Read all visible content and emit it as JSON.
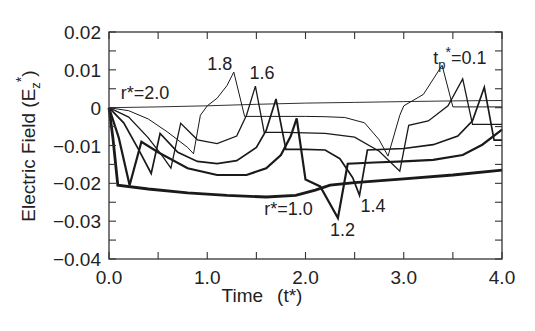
{
  "chart_data": {
    "type": "line",
    "title": "",
    "xlabel": "Time",
    "xlabel_symbol": "(t*)",
    "ylabel": "Electric Field (E",
    "ylabel_sub": "z",
    "ylabel_sup": "*",
    "ylabel_close": ")",
    "xlim": [
      0.0,
      4.0
    ],
    "ylim": [
      -0.04,
      0.02
    ],
    "grid": false,
    "legend": "none (inline annotations)",
    "x_ticks": [
      {
        "value": 0.0,
        "label": "0.0"
      },
      {
        "value": 1.0,
        "label": "1.0"
      },
      {
        "value": 2.0,
        "label": "2.0"
      },
      {
        "value": 3.0,
        "label": "3.0"
      },
      {
        "value": 4.0,
        "label": "4.0"
      }
    ],
    "x_minor_ticks": [
      0.5,
      1.5,
      2.5,
      3.5
    ],
    "y_ticks": [
      {
        "value": 0.02,
        "label": "0.02"
      },
      {
        "value": 0.01,
        "label": "0.01"
      },
      {
        "value": 0.0,
        "label": "0"
      },
      {
        "value": -0.01,
        "label": "−0.01"
      },
      {
        "value": -0.02,
        "label": "−0.02"
      },
      {
        "value": -0.03,
        "label": "−0.03"
      },
      {
        "value": -0.04,
        "label": "−0.04"
      }
    ],
    "y_minor_ticks": [
      0.015,
      0.005,
      -0.005,
      -0.015,
      -0.025,
      -0.035
    ],
    "series": [
      {
        "name": "r*=2.0",
        "stroke_width": 0.9,
        "points": [
          [
            0,
            0
          ],
          [
            0.5,
            0.0002
          ],
          [
            1.0,
            0.0005
          ],
          [
            1.5,
            0.0009
          ],
          [
            2.0,
            0.0012
          ],
          [
            2.5,
            0.0014
          ],
          [
            3.0,
            0.0016
          ],
          [
            3.5,
            0.0018
          ],
          [
            4.0,
            0.0019
          ]
        ]
      },
      {
        "name": "r*=1.8",
        "stroke_width": 1.0,
        "points": [
          [
            0,
            0
          ],
          [
            0.2,
            -0.0008
          ],
          [
            0.4,
            -0.003
          ],
          [
            0.6,
            -0.0065
          ],
          [
            0.8,
            -0.0105
          ],
          [
            0.86,
            -0.0122
          ],
          [
            0.93,
            -0.002
          ],
          [
            1.0,
            0.0005
          ],
          [
            1.1,
            0.0025
          ],
          [
            1.2,
            0.0058
          ],
          [
            1.27,
            0.0094
          ],
          [
            1.38,
            -0.0023
          ],
          [
            1.6,
            -0.0023
          ],
          [
            2.0,
            -0.0023
          ],
          [
            2.2,
            -0.0024
          ],
          [
            2.4,
            -0.0026
          ],
          [
            2.6,
            -0.004
          ],
          [
            2.75,
            -0.0085
          ],
          [
            2.84,
            -0.0128
          ],
          [
            2.96,
            -0.002
          ],
          [
            3.0,
            0.0005
          ],
          [
            3.2,
            0.0035
          ],
          [
            3.39,
            0.0112
          ],
          [
            3.5,
            0.0002
          ],
          [
            3.8,
            0.0002
          ],
          [
            4.0,
            0.0002
          ]
        ]
      },
      {
        "name": "r*=1.6",
        "stroke_width": 1.3,
        "points": [
          [
            0,
            0
          ],
          [
            0.2,
            -0.0025
          ],
          [
            0.4,
            -0.008
          ],
          [
            0.55,
            -0.013
          ],
          [
            0.63,
            -0.016
          ],
          [
            0.73,
            -0.0041
          ],
          [
            0.9,
            -0.0085
          ],
          [
            1.1,
            -0.0095
          ],
          [
            1.3,
            -0.0075
          ],
          [
            1.4,
            -0.002
          ],
          [
            1.49,
            0.0057
          ],
          [
            1.58,
            -0.0065
          ],
          [
            1.8,
            -0.0065
          ],
          [
            2.2,
            -0.0068
          ],
          [
            2.5,
            -0.0078
          ],
          [
            2.75,
            -0.0115
          ],
          [
            2.96,
            -0.0168
          ],
          [
            3.05,
            -0.0047
          ],
          [
            3.25,
            -0.0035
          ],
          [
            3.45,
            0.0005
          ],
          [
            3.6,
            0.0076
          ],
          [
            3.7,
            -0.0044
          ],
          [
            4.0,
            -0.0044
          ]
        ]
      },
      {
        "name": "r*=1.4",
        "stroke_width": 1.7,
        "points": [
          [
            0,
            0
          ],
          [
            0.15,
            -0.004
          ],
          [
            0.3,
            -0.011
          ],
          [
            0.43,
            -0.0174
          ],
          [
            0.52,
            -0.0068
          ],
          [
            0.7,
            -0.0118
          ],
          [
            0.9,
            -0.0142
          ],
          [
            1.1,
            -0.0148
          ],
          [
            1.3,
            -0.014
          ],
          [
            1.5,
            -0.0105
          ],
          [
            1.6,
            -0.006
          ],
          [
            1.7,
            0.0023
          ],
          [
            1.8,
            -0.011
          ],
          [
            2.0,
            -0.011
          ],
          [
            2.2,
            -0.0112
          ],
          [
            2.35,
            -0.0135
          ],
          [
            2.48,
            -0.0185
          ],
          [
            2.55,
            -0.0232
          ],
          [
            2.63,
            -0.0112
          ],
          [
            3.0,
            -0.0108
          ],
          [
            3.3,
            -0.0098
          ],
          [
            3.55,
            -0.0075
          ],
          [
            3.7,
            -0.0035
          ],
          [
            3.82,
            0.0054
          ],
          [
            3.92,
            -0.0086
          ],
          [
            4.0,
            -0.0086
          ]
        ]
      },
      {
        "name": "r*=1.2",
        "stroke_width": 2.2,
        "points": [
          [
            0,
            0
          ],
          [
            0.1,
            -0.008
          ],
          [
            0.21,
            -0.0205
          ],
          [
            0.33,
            -0.009
          ],
          [
            0.5,
            -0.0118
          ],
          [
            0.8,
            -0.016
          ],
          [
            1.1,
            -0.0178
          ],
          [
            1.4,
            -0.0178
          ],
          [
            1.6,
            -0.016
          ],
          [
            1.75,
            -0.0125
          ],
          [
            1.85,
            -0.0075
          ],
          [
            1.91,
            -0.0028
          ],
          [
            2.0,
            -0.019
          ],
          [
            2.15,
            -0.0208
          ],
          [
            2.33,
            -0.0292
          ],
          [
            2.43,
            -0.0148
          ],
          [
            2.7,
            -0.0145
          ],
          [
            3.0,
            -0.0142
          ],
          [
            3.3,
            -0.0138
          ],
          [
            3.6,
            -0.0125
          ],
          [
            3.8,
            -0.0098
          ],
          [
            4.0,
            -0.0058
          ]
        ]
      },
      {
        "name": "r*=1.0",
        "stroke_width": 2.8,
        "points": [
          [
            0,
            0
          ],
          [
            0.04,
            -0.008
          ],
          [
            0.09,
            -0.0205
          ],
          [
            0.4,
            -0.0215
          ],
          [
            0.8,
            -0.0225
          ],
          [
            1.2,
            -0.0232
          ],
          [
            1.6,
            -0.0236
          ],
          [
            1.9,
            -0.0232
          ],
          [
            2.1,
            -0.0218
          ],
          [
            2.25,
            -0.0205
          ],
          [
            2.5,
            -0.0198
          ],
          [
            3.0,
            -0.0188
          ],
          [
            3.5,
            -0.0178
          ],
          [
            4.0,
            -0.0165
          ]
        ]
      }
    ],
    "annotations": [
      {
        "text": "r*=2.0",
        "t": 0.12,
        "E": 0.0022
      },
      {
        "text": "1.8",
        "t": 1.0,
        "E": 0.01
      },
      {
        "text": "1.6",
        "t": 1.43,
        "E": 0.0075
      },
      {
        "text": "t",
        "sub": "p",
        "sup": "*",
        "rest": "=0.1",
        "t": 3.3,
        "E": 0.0115
      },
      {
        "text": "r*=1.0",
        "t": 1.58,
        "E": -0.0285
      },
      {
        "text": "1.4",
        "t": 2.56,
        "E": -0.0277
      },
      {
        "text": "1.2",
        "t": 2.25,
        "E": -0.0338
      }
    ]
  }
}
